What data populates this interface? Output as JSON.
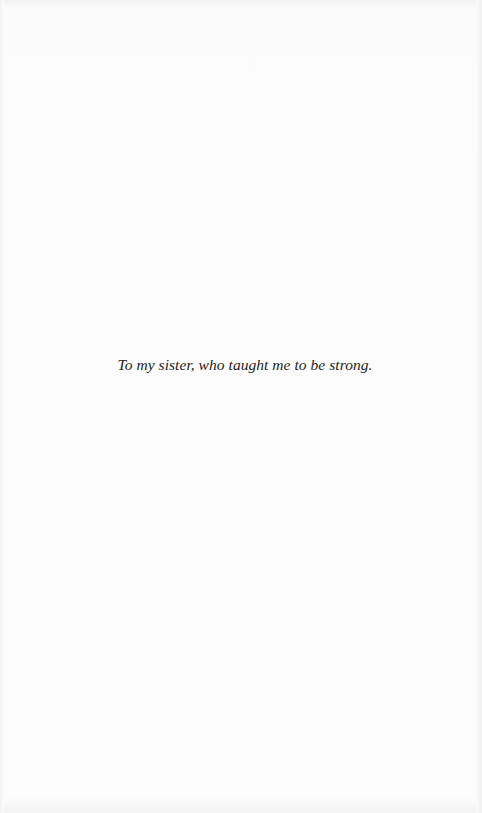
{
  "page": {
    "type": "dedication",
    "dedication_text": "To my sister, who taught me to be strong."
  }
}
